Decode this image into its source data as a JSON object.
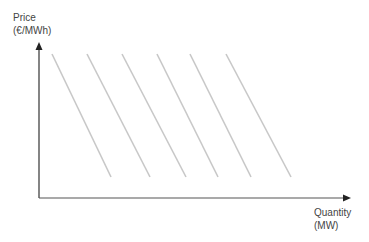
{
  "diagram": {
    "y_axis": {
      "label_line1": "Price",
      "label_line2": "(€/MWh)"
    },
    "x_axis": {
      "label_line1": "Quantity",
      "label_line2": "(MW)"
    },
    "line_color": "#c8c8c8",
    "axis_color": "#333333",
    "lines": [
      {
        "x1": 52,
        "y1": 54,
        "x2": 111,
        "y2": 177
      },
      {
        "x1": 87,
        "y1": 54,
        "x2": 150,
        "y2": 177
      },
      {
        "x1": 122,
        "y1": 54,
        "x2": 186,
        "y2": 177
      },
      {
        "x1": 157,
        "y1": 54,
        "x2": 218,
        "y2": 177
      },
      {
        "x1": 190,
        "y1": 54,
        "x2": 251,
        "y2": 177
      },
      {
        "x1": 226,
        "y1": 54,
        "x2": 291,
        "y2": 177
      }
    ]
  }
}
